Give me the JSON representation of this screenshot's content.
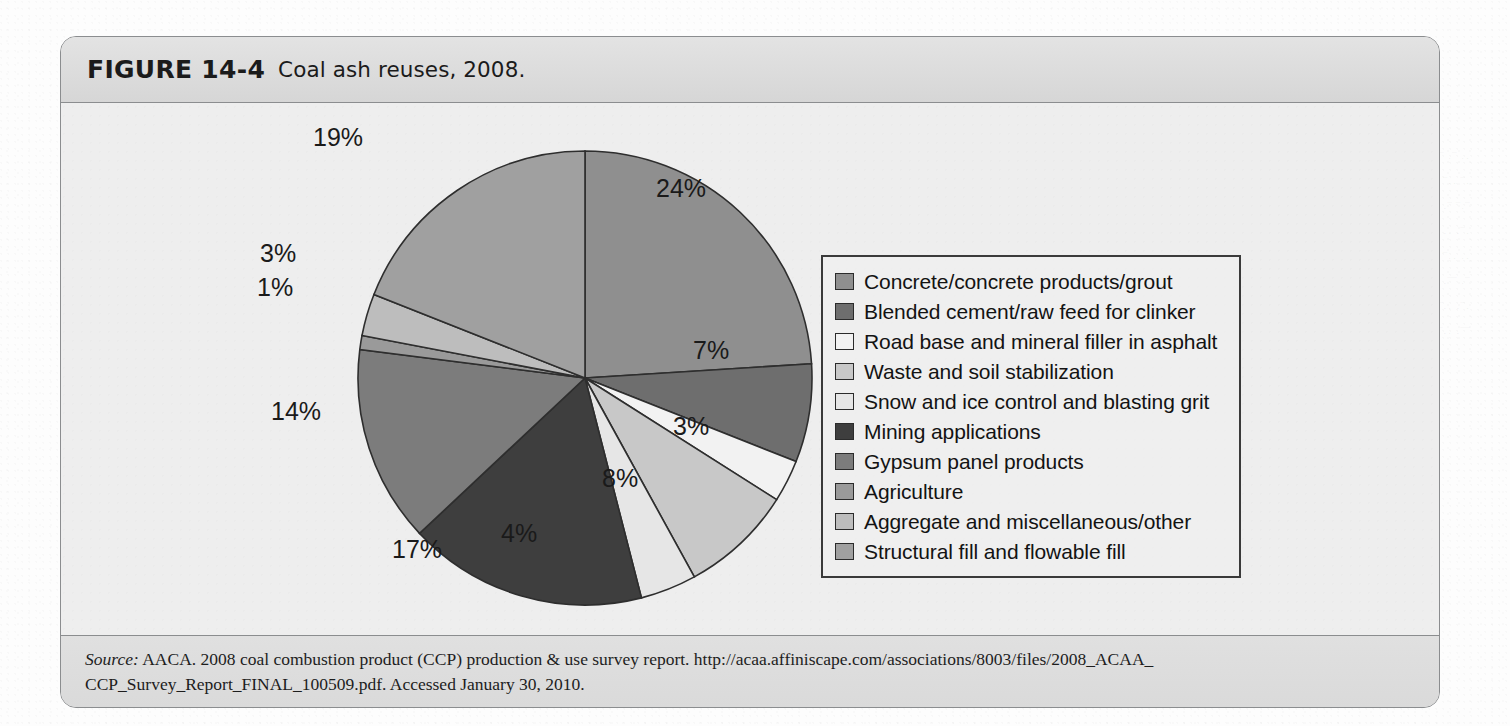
{
  "figure": {
    "label": "FIGURE 14-4",
    "caption": "Coal ash reuses, 2008."
  },
  "source": {
    "prefix": "Source:",
    "line1": " AACA. 2008 coal combustion product (CCP) production & use survey report. http://acaa.affiniscape.com/associations/8003/files/2008_ACAA_",
    "line2": "CCP_Survey_Report_FINAL_100509.pdf. Accessed January 30, 2010."
  },
  "background_bleed": {
    "left": "unreadable show-through text from the reverse side of the page",
    "right": "faint bleed-through body text column"
  },
  "chart_data": {
    "type": "pie",
    "title": "Coal ash reuses, 2008.",
    "unit": "percent",
    "start_angle_deg": -90,
    "direction": "clockwise",
    "total": 100,
    "categories": [
      "Concrete/concrete products/grout",
      "Blended cement/raw feed for clinker",
      "Road base and mineral filler in asphalt",
      "Waste and soil stabilization",
      "Snow and ice control and blasting grit",
      "Mining applications",
      "Gypsum panel products",
      "Agriculture",
      "Aggregate and miscellaneous/other",
      "Structural fill and flowable fill"
    ],
    "values": [
      24,
      7,
      3,
      8,
      4,
      17,
      14,
      1,
      3,
      19
    ],
    "labels": [
      "24%",
      "7%",
      "3%",
      "8%",
      "4%",
      "17%",
      "14%",
      "1%",
      "3%",
      "19%"
    ],
    "colors": [
      "#8f8f8f",
      "#6e6e6e",
      "#f2f2f2",
      "#c8c8c8",
      "#e6e6e6",
      "#3e3e3e",
      "#7c7c7c",
      "#9a9a9a",
      "#bdbdbd",
      "#a0a0a0"
    ],
    "legend_position": "right",
    "grid": false
  },
  "legend": {
    "entries": [
      {
        "label": "Concrete/concrete products/grout",
        "color": "#8f8f8f"
      },
      {
        "label": "Blended cement/raw feed for clinker",
        "color": "#6e6e6e"
      },
      {
        "label": "Road base and mineral filler in asphalt",
        "color": "#f2f2f2"
      },
      {
        "label": "Waste and soil stabilization",
        "color": "#c8c8c8"
      },
      {
        "label": "Snow and ice control and blasting grit",
        "color": "#e6e6e6"
      },
      {
        "label": "Mining applications",
        "color": "#3e3e3e"
      },
      {
        "label": "Gypsum panel products",
        "color": "#7c7c7c"
      },
      {
        "label": "Agriculture",
        "color": "#9a9a9a"
      },
      {
        "label": "Aggregate and miscellaneous/other",
        "color": "#bdbdbd"
      },
      {
        "label": "Structural fill and flowable fill",
        "color": "#a0a0a0"
      }
    ]
  },
  "pct_label_positions": [
    {
      "text": "24%",
      "left": 359,
      "top": 64
    },
    {
      "text": "7%",
      "left": 396,
      "top": 226
    },
    {
      "text": "3%",
      "left": 376,
      "top": 302
    },
    {
      "text": "8%",
      "left": 305,
      "top": 354
    },
    {
      "text": "4%",
      "left": 204,
      "top": 409
    },
    {
      "text": "17%",
      "left": 95,
      "top": 425
    },
    {
      "text": "14%",
      "left": -26,
      "top": 287
    },
    {
      "text": "1%",
      "left": -40,
      "top": 163
    },
    {
      "text": "3%",
      "left": -37,
      "top": 129
    },
    {
      "text": "19%",
      "left": 16,
      "top": 13
    }
  ]
}
